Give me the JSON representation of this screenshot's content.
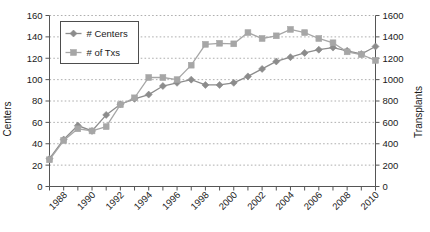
{
  "chart_data": {
    "type": "line",
    "title": "",
    "xlabel": "",
    "ylabel": "Centers",
    "y2label": "Transplants",
    "grid": true,
    "legend_position": "top-left",
    "x": [
      1987,
      1988,
      1989,
      1990,
      1991,
      1992,
      1993,
      1994,
      1995,
      1996,
      1997,
      1998,
      1999,
      2000,
      2001,
      2002,
      2003,
      2004,
      2005,
      2006,
      2007,
      2008,
      2009,
      2010
    ],
    "xtick_labels": [
      "1988",
      "1990",
      "1992",
      "1994",
      "1996",
      "1998",
      "2000",
      "2002",
      "2004",
      "2006",
      "2008",
      "2010"
    ],
    "xtick_values": [
      1988,
      1990,
      1992,
      1994,
      1996,
      1998,
      2000,
      2002,
      2004,
      2006,
      2008,
      2010
    ],
    "ylim": [
      0,
      160
    ],
    "ytick_values": [
      0,
      20,
      40,
      60,
      80,
      100,
      120,
      140,
      160
    ],
    "ytick_labels": [
      "0",
      "20",
      "40",
      "60",
      "80",
      "100",
      "120",
      "140",
      "160"
    ],
    "y2lim": [
      0,
      1600
    ],
    "y2tick_values": [
      0,
      200,
      400,
      600,
      800,
      1000,
      1200,
      1400,
      1600
    ],
    "y2tick_labels": [
      "0",
      "200",
      "400",
      "600",
      "800",
      "1000",
      "1200",
      "1400",
      "1600"
    ],
    "series": [
      {
        "name": "# Centers",
        "axis": "left",
        "color": "#8c8c8c",
        "marker": "diamond",
        "values": [
          26,
          44,
          57,
          52,
          67,
          77,
          82,
          86,
          94,
          97,
          100,
          95,
          95,
          97,
          103,
          110,
          117,
          121,
          125,
          128,
          130,
          127,
          124,
          131
        ]
      },
      {
        "name": "# of Txs",
        "axis": "right",
        "color": "#a6a6a6",
        "marker": "square",
        "values": [
          250,
          430,
          540,
          520,
          560,
          765,
          830,
          1020,
          1020,
          1000,
          1135,
          1330,
          1340,
          1335,
          1440,
          1385,
          1410,
          1470,
          1440,
          1385,
          1345,
          1260,
          1235,
          1180
        ]
      }
    ]
  },
  "legend": {
    "items": [
      {
        "label": "# Centers"
      },
      {
        "label": "# of Txs"
      }
    ]
  },
  "axes": {
    "left_title": "Centers",
    "right_title": "Transplants"
  }
}
